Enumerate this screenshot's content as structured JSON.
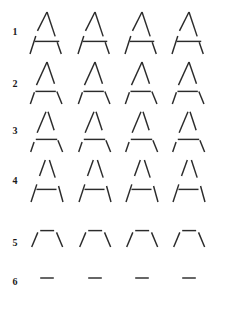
{
  "figure": {
    "background_color": "#ffffff",
    "stroke_color": "#2b2b2b",
    "label_color": "#1a1a1a",
    "rows_count": 6,
    "columns_count": 4,
    "width_px": 228,
    "height_px": 319
  },
  "rows": [
    {
      "label": "1",
      "label_y": 27,
      "row_top": 12,
      "glyph_width": 34,
      "glyph_height": 42,
      "fragmentation_level": 1,
      "description": "near-complete A, small gaps",
      "columns": [
        {
          "x": 30
        },
        {
          "x": 78
        },
        {
          "x": 125
        },
        {
          "x": 172
        }
      ],
      "segments": {
        "left_diagonal": [
          [
            0.0,
            1.0,
            0.17,
            0.57
          ],
          [
            0.22,
            0.45,
            0.5,
            0.0
          ]
        ],
        "right_diagonal": [
          [
            0.5,
            0.0,
            0.74,
            0.58
          ],
          [
            0.8,
            0.72,
            0.92,
            1.0
          ]
        ],
        "crossbar": [
          [
            0.14,
            0.7,
            0.86,
            0.7
          ]
        ]
      }
    },
    {
      "label": "2",
      "label_y": 79,
      "row_top": 62,
      "glyph_width": 34,
      "glyph_height": 42,
      "fragmentation_level": 2,
      "description": "A with moderate gaps in both diagonals",
      "columns": [
        {
          "x": 30
        },
        {
          "x": 78
        },
        {
          "x": 125
        },
        {
          "x": 172
        }
      ],
      "segments": {
        "left_diagonal": [
          [
            0.01,
            1.0,
            0.13,
            0.72
          ],
          [
            0.19,
            0.55,
            0.5,
            0.0
          ]
        ],
        "right_diagonal": [
          [
            0.5,
            0.0,
            0.72,
            0.52
          ],
          [
            0.79,
            0.7,
            0.94,
            1.0
          ]
        ],
        "crossbar": [
          [
            0.16,
            0.7,
            0.76,
            0.7
          ]
        ]
      }
    },
    {
      "label": "3",
      "label_y": 126,
      "row_top": 110,
      "glyph_width": 34,
      "glyph_height": 42,
      "fragmentation_level": 3,
      "description": "A with larger gaps, bottom ends detached",
      "columns": [
        {
          "x": 30
        },
        {
          "x": 78
        },
        {
          "x": 125
        },
        {
          "x": 172
        }
      ],
      "segments": {
        "left_diagonal": [
          [
            0.02,
            1.0,
            0.12,
            0.76
          ],
          [
            0.21,
            0.54,
            0.47,
            0.04
          ]
        ],
        "right_diagonal": [
          [
            0.53,
            0.04,
            0.71,
            0.48
          ],
          [
            0.82,
            0.72,
            0.96,
            1.0
          ]
        ],
        "crossbar": [
          [
            0.17,
            0.7,
            0.8,
            0.7
          ]
        ]
      }
    },
    {
      "label": "4",
      "label_y": 176,
      "row_top": 160,
      "glyph_width": 34,
      "glyph_height": 42,
      "fragmentation_level": 4,
      "description": "A heavily fragmented, apex split open",
      "columns": [
        {
          "x": 30
        },
        {
          "x": 78
        },
        {
          "x": 125
        },
        {
          "x": 172
        }
      ],
      "segments": {
        "left_diagonal": [
          [
            0.03,
            1.0,
            0.2,
            0.58
          ],
          [
            0.28,
            0.38,
            0.45,
            0.0
          ]
        ],
        "right_diagonal": [
          [
            0.57,
            0.0,
            0.74,
            0.42
          ],
          [
            0.84,
            0.62,
            0.97,
            1.0
          ]
        ],
        "crossbar": [
          [
            0.19,
            0.7,
            0.78,
            0.7
          ]
        ]
      }
    },
    {
      "label": "5",
      "label_y": 238,
      "row_top": 228,
      "glyph_width": 34,
      "glyph_height": 20,
      "fragmentation_level": 5,
      "description": "only apex region remains: short left slash, flat top, short right slash",
      "columns": [
        {
          "x": 30
        },
        {
          "x": 78
        },
        {
          "x": 125
        },
        {
          "x": 172
        }
      ],
      "segments": {
        "left_diagonal": [
          [
            0.05,
            0.95,
            0.23,
            0.22
          ]
        ],
        "right_diagonal": [
          [
            0.78,
            0.22,
            0.96,
            0.95
          ]
        ],
        "crossbar": [
          [
            0.3,
            0.13,
            0.71,
            0.13
          ]
        ]
      }
    },
    {
      "label": "6",
      "label_y": 277,
      "row_top": 272,
      "glyph_width": 34,
      "glyph_height": 12,
      "fragmentation_level": 6,
      "description": "only a single short horizontal dash remains",
      "columns": [
        {
          "x": 30
        },
        {
          "x": 78
        },
        {
          "x": 125
        },
        {
          "x": 172
        }
      ],
      "segments": {
        "left_diagonal": [],
        "right_diagonal": [],
        "crossbar": [
          [
            0.3,
            0.5,
            0.7,
            0.5
          ]
        ]
      }
    }
  ]
}
